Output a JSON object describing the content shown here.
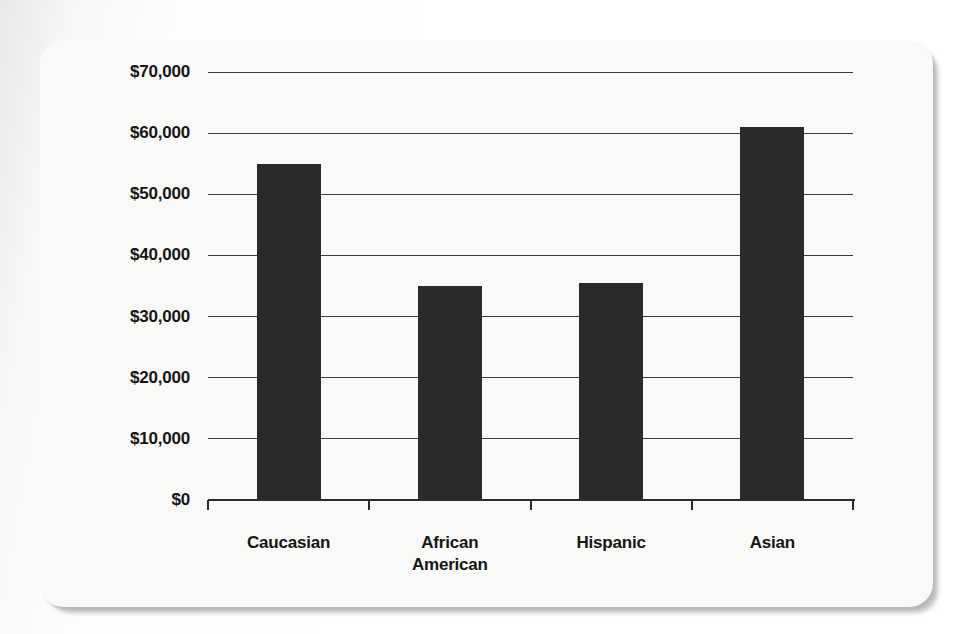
{
  "panel": {
    "background_color": "#f9f9f7",
    "shadow_color": "#949491"
  },
  "chart_data": {
    "type": "bar",
    "title": "",
    "xlabel": "",
    "ylabel": "",
    "categories": [
      "Caucasian",
      "African American",
      "Hispanic",
      "Asian"
    ],
    "values": [
      55000,
      35000,
      35500,
      61000
    ],
    "ylim": [
      0,
      70000
    ],
    "ytick_interval": 10000,
    "ytick_labels": [
      "$0",
      "$10,000",
      "$20,000",
      "$30,000",
      "$40,000",
      "$50,000",
      "$60,000",
      "$70,000"
    ],
    "grid": true,
    "legend": "none",
    "bar_color": "#2b2a28",
    "gridline_color": "#3d3d3b",
    "axis_color": "#2c2c2a",
    "text_color": "#161616"
  }
}
